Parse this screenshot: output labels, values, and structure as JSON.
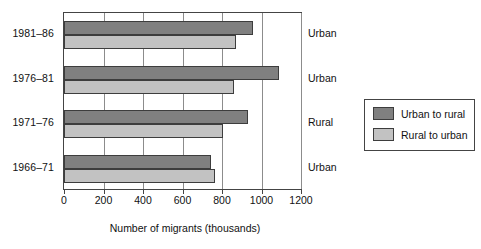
{
  "chart_data": {
    "type": "bar",
    "orientation": "horizontal",
    "title": "",
    "xlabel": "Number of migrants (thousands)",
    "ylabel": "",
    "xlim": [
      0,
      1200
    ],
    "xticks": [
      0,
      200,
      400,
      600,
      800,
      1000,
      1200
    ],
    "xtick_labels": [
      "0",
      "200",
      "400",
      "600",
      "800",
      "1000",
      "1200"
    ],
    "grid": true,
    "grid_axis": "x",
    "legend_position": "right",
    "categories": [
      "1981–86",
      "1976–81",
      "1971–76",
      "1966–71"
    ],
    "series": [
      {
        "name": "Urban to rural",
        "color": "#808080",
        "values": [
          955,
          1090,
          930,
          745
        ]
      },
      {
        "name": "Rural to urban",
        "color": "#c2c2c2",
        "values": [
          870,
          860,
          805,
          765
        ]
      }
    ],
    "annotations": {
      "side_labels": [
        "Urban",
        "Urban",
        "Rural",
        "Urban"
      ],
      "side_label_note": "net-flow direction label shown to the right of each period group"
    }
  },
  "legend": {
    "entries": [
      {
        "label": "Urban to rural",
        "swatch": "dark"
      },
      {
        "label": "Rural to urban",
        "swatch": "light"
      }
    ]
  },
  "colors": {
    "series_dark": "#808080",
    "series_light": "#c2c2c2",
    "axis": "#444444",
    "grid": "#8c8c8c",
    "text": "#111111"
  }
}
